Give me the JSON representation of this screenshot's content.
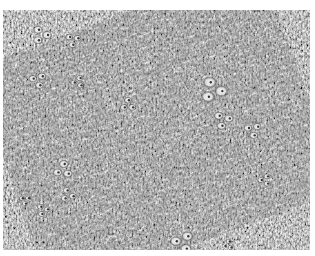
{
  "image": {
    "kind": "grayscale histology micrograph",
    "description": "Dense spindle-cell stroma with scattered clusters of clear vacuolated cells",
    "frame": {
      "x": 3,
      "y": 10,
      "width": 307,
      "height": 240
    },
    "colors": {
      "background": "#ffffff",
      "stroma_mid": "#8a8a8a",
      "stroma_dark": "#3a3a3a",
      "clear_cells": "#f2f2f2"
    },
    "clear_cell_clusters": [
      {
        "cx": 38,
        "cy": 25,
        "r": 10
      },
      {
        "cx": 70,
        "cy": 30,
        "r": 8
      },
      {
        "cx": 35,
        "cy": 70,
        "r": 9
      },
      {
        "cx": 75,
        "cy": 72,
        "r": 7
      },
      {
        "cx": 125,
        "cy": 95,
        "r": 8
      },
      {
        "cx": 210,
        "cy": 80,
        "r": 14
      },
      {
        "cx": 220,
        "cy": 110,
        "r": 10
      },
      {
        "cx": 250,
        "cy": 120,
        "r": 9
      },
      {
        "cx": 262,
        "cy": 170,
        "r": 7
      },
      {
        "cx": 60,
        "cy": 160,
        "r": 10
      },
      {
        "cx": 65,
        "cy": 185,
        "r": 8
      },
      {
        "cx": 40,
        "cy": 200,
        "r": 7
      },
      {
        "cx": 22,
        "cy": 190,
        "r": 6
      },
      {
        "cx": 180,
        "cy": 232,
        "r": 12
      },
      {
        "cx": 225,
        "cy": 235,
        "r": 6
      }
    ]
  }
}
